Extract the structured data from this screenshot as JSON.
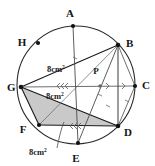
{
  "figure": {
    "background_color": "#ffffff",
    "stroke_color": "#1a1a1a",
    "shaded_fill_color": "#c9c9c9",
    "circle": {
      "center_x": 76,
      "center_y": 85,
      "radius": 59
    },
    "vertices": [
      {
        "id": "A",
        "label": "A",
        "px": 73,
        "py": 26,
        "lx": 70,
        "ly": 17
      },
      {
        "id": "B",
        "label": "B",
        "px": 118,
        "py": 45,
        "lx": 126,
        "ly": 47
      },
      {
        "id": "C",
        "label": "C",
        "px": 135,
        "py": 86,
        "lx": 142,
        "ly": 89
      },
      {
        "id": "D",
        "label": "D",
        "px": 118,
        "py": 126,
        "lx": 124,
        "ly": 136
      },
      {
        "id": "E",
        "label": "E",
        "px": 78,
        "py": 143,
        "lx": 75,
        "ly": 161
      },
      {
        "id": "F",
        "label": "F",
        "px": 39,
        "py": 125,
        "lx": 23,
        "ly": 133
      },
      {
        "id": "G",
        "label": "G",
        "px": 21,
        "py": 87,
        "lx": 6,
        "ly": 91
      },
      {
        "id": "H",
        "label": "H",
        "px": 38,
        "py": 43,
        "lx": 22,
        "ly": 46
      }
    ],
    "intersection_point": {
      "id": "P",
      "label": "P",
      "px": 100,
      "py": 86,
      "lx": 96,
      "ly": 74
    },
    "chords": [
      {
        "from": "G",
        "to": "B"
      },
      {
        "from": "G",
        "to": "C"
      },
      {
        "from": "G",
        "to": "D"
      },
      {
        "from": "G",
        "to": "F"
      },
      {
        "from": "F",
        "to": "D"
      },
      {
        "from": "B",
        "to": "D"
      },
      {
        "from": "B",
        "to": "C"
      },
      {
        "from": "C",
        "to": "D"
      },
      {
        "from": "A",
        "to": "E"
      },
      {
        "from": "B",
        "to": "E"
      },
      {
        "from": "B",
        "to": "F"
      }
    ],
    "shaded_region": {
      "name": "triangle-GFD",
      "points": "G,F,D"
    },
    "area_labels": [
      {
        "text": "8cm",
        "sup": "2",
        "x": 58,
        "y": 72,
        "id": "area-upper"
      },
      {
        "text": "8cm",
        "sup": "2",
        "x": 57,
        "y": 99,
        "id": "area-middle"
      },
      {
        "text": "8cm",
        "sup": "2",
        "x": 28,
        "y": 154,
        "id": "area-lower"
      }
    ],
    "leader_line": {
      "from_x": 57,
      "from_y": 148,
      "to_x": 64,
      "to_y": 122
    },
    "tick_marks": [
      {
        "id": "tick-gp-triple",
        "x": 62,
        "y": 86,
        "count": 3,
        "orient": "left"
      },
      {
        "id": "tick-pc-single",
        "x": 118,
        "y": 86,
        "count": 1,
        "orient": "right"
      },
      {
        "id": "tick-fd-triple",
        "x": 78,
        "y": 127,
        "count": 3,
        "orient": "left"
      }
    ]
  }
}
